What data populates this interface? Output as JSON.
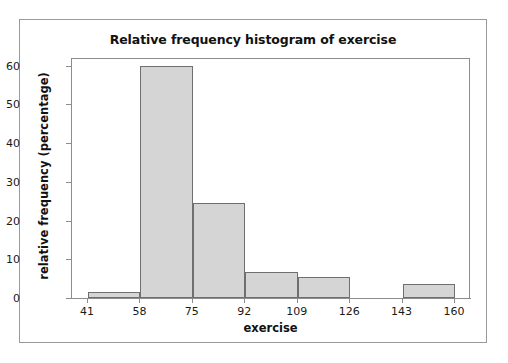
{
  "chart_data": {
    "type": "bar",
    "title": "Relative frequency histogram of exercise",
    "xlabel": "exercise",
    "ylabel": "relative frequency (percentage)",
    "xlim": [
      41,
      160
    ],
    "ylim": [
      0,
      62
    ],
    "grid": false,
    "legend": null,
    "bin_width": 17,
    "bin_edges": [
      41,
      58,
      75,
      92,
      109,
      126,
      143,
      160
    ],
    "xticks": [
      "41",
      "58",
      "75",
      "92",
      "109",
      "126",
      "143",
      "160"
    ],
    "yticks": [
      "0",
      "10",
      "20",
      "30",
      "40",
      "50",
      "60"
    ],
    "categories": [
      "41-58",
      "58-75",
      "75-92",
      "92-109",
      "109-126",
      "126-143",
      "143-160"
    ],
    "values": [
      1.6,
      60.0,
      24.5,
      6.8,
      5.4,
      0,
      3.5
    ],
    "bars": [
      {
        "label": "41-58",
        "start": 41,
        "end": 58,
        "value": 1.6
      },
      {
        "label": "58-75",
        "start": 58,
        "end": 75,
        "value": 60.0
      },
      {
        "label": "75-92",
        "start": 75,
        "end": 92,
        "value": 24.5
      },
      {
        "label": "92-109",
        "start": 92,
        "end": 109,
        "value": 6.8
      },
      {
        "label": "109-126",
        "start": 109,
        "end": 126,
        "value": 5.4
      },
      {
        "label": "126-143",
        "start": 126,
        "end": 143,
        "value": 0
      },
      {
        "label": "143-160",
        "start": 143,
        "end": 160,
        "value": 3.5
      }
    ],
    "colors": {
      "bar_fill": "#d5d5d5",
      "bar_edge": "#6f6f6f",
      "axis": "#8d8d8d",
      "text": "#111111",
      "background": "#ffffff",
      "border": "#9a9a9a"
    }
  }
}
